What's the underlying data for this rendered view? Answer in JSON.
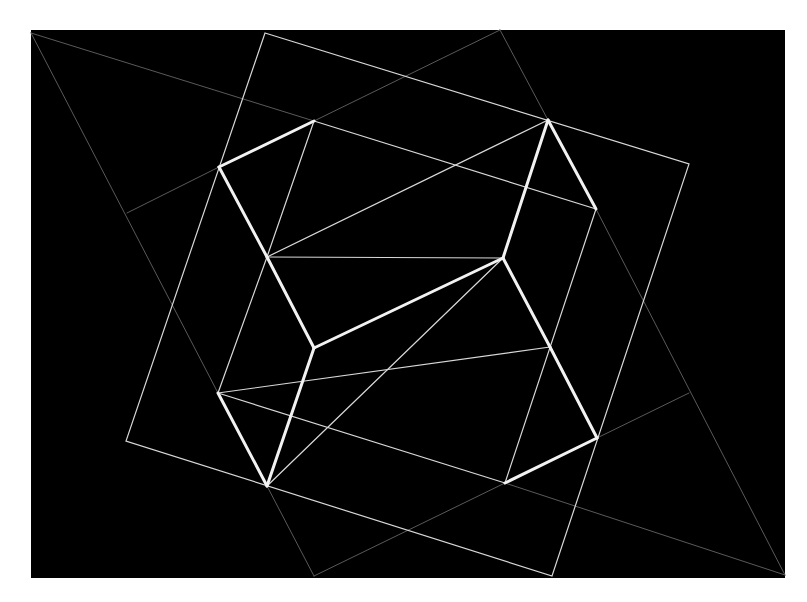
{
  "colors": {
    "page": "#ffffff",
    "panel": "#000000",
    "thick": "#f2f2f2",
    "thin": "#d8d8d8",
    "faint": "#5a5a5a"
  },
  "panel": {
    "x": 31,
    "y": 30,
    "width": 754,
    "height": 548
  },
  "outer_square": [
    [
      265,
      33
    ],
    [
      689,
      164
    ],
    [
      552,
      576
    ],
    [
      126,
      441
    ]
  ],
  "thick_lines": [
    [
      [
        219,
        167
      ],
      [
        314,
        121
      ]
    ],
    [
      [
        219,
        167
      ],
      [
        267,
        257
      ]
    ],
    [
      [
        267,
        257
      ],
      [
        314,
        348
      ]
    ],
    [
      [
        314,
        348
      ],
      [
        503,
        258
      ]
    ],
    [
      [
        503,
        258
      ],
      [
        548,
        120
      ]
    ],
    [
      [
        548,
        120
      ],
      [
        596,
        209
      ]
    ],
    [
      [
        503,
        258
      ],
      [
        550,
        347
      ]
    ],
    [
      [
        550,
        347
      ],
      [
        597,
        438
      ]
    ],
    [
      [
        597,
        438
      ],
      [
        505,
        483
      ]
    ],
    [
      [
        218,
        393
      ],
      [
        267,
        486
      ]
    ],
    [
      [
        267,
        486
      ],
      [
        314,
        348
      ]
    ]
  ],
  "thin_lines": [
    [
      [
        314,
        121
      ],
      [
        267,
        257
      ]
    ],
    [
      [
        314,
        121
      ],
      [
        596,
        209
      ]
    ],
    [
      [
        267,
        257
      ],
      [
        548,
        120
      ]
    ],
    [
      [
        267,
        257
      ],
      [
        503,
        258
      ]
    ],
    [
      [
        503,
        258
      ],
      [
        267,
        486
      ]
    ],
    [
      [
        218,
        393
      ],
      [
        550,
        347
      ]
    ],
    [
      [
        218,
        393
      ],
      [
        505,
        483
      ]
    ],
    [
      [
        596,
        209
      ],
      [
        505,
        483
      ]
    ],
    [
      [
        267,
        257
      ],
      [
        218,
        393
      ]
    ]
  ],
  "faint_lines": [
    [
      [
        31,
        33
      ],
      [
        218,
        393
      ]
    ],
    [
      [
        31,
        33
      ],
      [
        314,
        121
      ]
    ],
    [
      [
        314,
        121
      ],
      [
        500,
        30
      ]
    ],
    [
      [
        500,
        30
      ],
      [
        548,
        120
      ]
    ],
    [
      [
        596,
        209
      ],
      [
        785,
        575
      ]
    ],
    [
      [
        785,
        575
      ],
      [
        505,
        483
      ]
    ],
    [
      [
        597,
        438
      ],
      [
        689,
        393
      ]
    ],
    [
      [
        219,
        167
      ],
      [
        127,
        213
      ]
    ],
    [
      [
        267,
        486
      ],
      [
        314,
        576
      ]
    ],
    [
      [
        314,
        576
      ],
      [
        505,
        483
      ]
    ]
  ]
}
